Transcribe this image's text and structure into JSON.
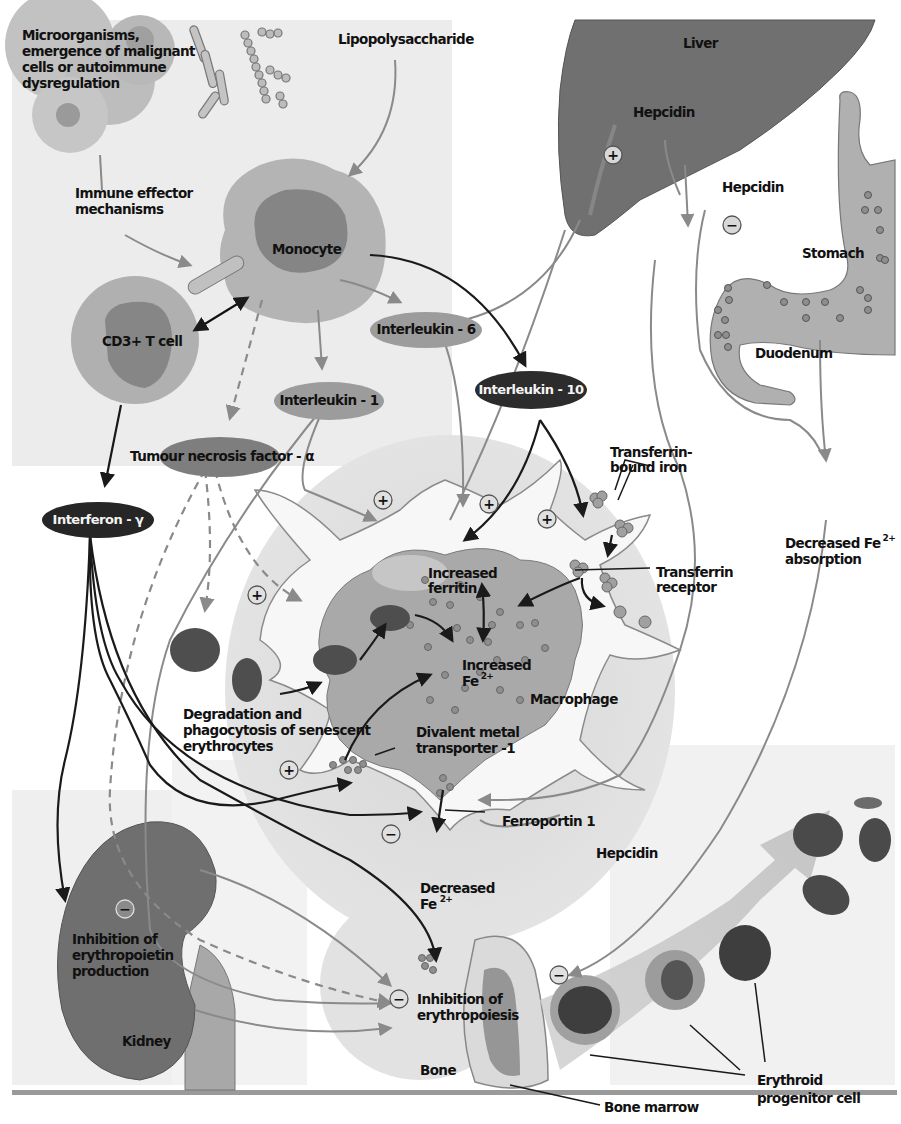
{
  "diagram": {
    "colors": {
      "panel_bg": "#ececec",
      "organ_dark": "#6e6e6e",
      "cell_light": "#b9b9b9",
      "cell_mid": "#8c8c8c",
      "cytokine_light": "#9c9c9c",
      "cytokine_dark": "#2a2a2a",
      "erythrocyte": "#4a4a4a",
      "arrow_gray": "#8a8a8a",
      "arrow_black": "#1a1a1a",
      "macrophage_halo": "#dcdcdc"
    },
    "labels": {
      "microorganisms": [
        "Microorganisms,",
        "emergence of malignant",
        "cells or autoimmune",
        "dysregulation"
      ],
      "lipopolysaccharide": "Lipopolysaccharide",
      "liver": "Liver",
      "hepcidin_liver": "Hepcidin",
      "hepcidin_right": "Hepcidin",
      "stomach": "Stomach",
      "duodenum": "Duodenum",
      "immune_effector": [
        "Immune effector",
        "mechanisms"
      ],
      "monocyte": "Monocyte",
      "cd3_t_cell": "CD3+ T cell",
      "interleukin_6": "Interleukin - 6",
      "interleukin_10": "Interleukin - 10",
      "interleukin_1": "Interleukin - 1",
      "tnf_alpha": "Tumour necrosis factor - α",
      "interferon_gamma": "Interferon - γ",
      "transferrin_bound_iron": [
        "Transferrin-",
        "bound iron"
      ],
      "transferrin_receptor": [
        "Transferrin",
        "receptor"
      ],
      "increased_ferritin": [
        "Increased",
        "ferritin"
      ],
      "increased_fe": [
        "Increased",
        "Fe"
      ],
      "fe_superscript": "2+",
      "macrophage": "Macrophage",
      "decreased_fe_absorption": [
        "Decreased Fe",
        "absorption"
      ],
      "degradation": [
        "Degradation and",
        "phagocytosis of senescent",
        "erythrocytes"
      ],
      "dmt1": [
        "Divalent metal",
        "transporter -1"
      ],
      "ferroportin": "Ferroportin 1",
      "hepcidin_macrophage": "Hepcidin",
      "decreased_fe": [
        "Decreased",
        "Fe"
      ],
      "inhibition_epo": [
        "Inhibition of",
        "erythropoietin",
        "production"
      ],
      "kidney": "Kidney",
      "inhibition_erythropoiesis": [
        "Inhibition of",
        "erythropoiesis"
      ],
      "bone": "Bone",
      "bone_marrow": "Bone marrow",
      "erythroid_progenitor": [
        "Erythroid",
        "progenitor cell"
      ]
    },
    "signs": {
      "plus": "+",
      "minus": "−"
    }
  }
}
